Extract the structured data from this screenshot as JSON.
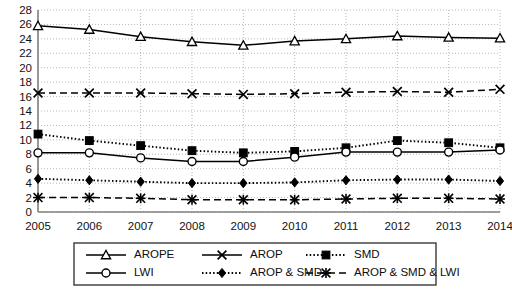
{
  "chart_data": {
    "type": "line",
    "title": "",
    "subtitle": "",
    "xlabel": "",
    "ylabel": "",
    "categories": [
      "2005",
      "2006",
      "2007",
      "2008",
      "2009",
      "2010",
      "2011",
      "2012",
      "2013",
      "2014"
    ],
    "x": [
      2005,
      2006,
      2007,
      2008,
      2009,
      2010,
      2011,
      2012,
      2013,
      2014
    ],
    "ylim": [
      0,
      28
    ],
    "xlim": [
      2005,
      2014
    ],
    "y_ticks": [
      0,
      2,
      4,
      6,
      8,
      10,
      12,
      14,
      16,
      18,
      20,
      22,
      24,
      26,
      28
    ],
    "grid": true,
    "grid_style": "dotted",
    "legend_position": "bottom",
    "series": [
      {
        "name": "AROPE",
        "marker": "triangle",
        "line_style": "solid",
        "values": [
          25.8,
          25.3,
          24.3,
          23.6,
          23.1,
          23.7,
          24.0,
          24.4,
          24.2,
          24.1
        ]
      },
      {
        "name": "AROP",
        "marker": "x",
        "line_style": "dashed",
        "values": [
          16.5,
          16.5,
          16.5,
          16.4,
          16.3,
          16.4,
          16.6,
          16.7,
          16.6,
          17.0
        ]
      },
      {
        "name": "SMD",
        "marker": "square",
        "line_style": "dotted",
        "values": [
          10.8,
          9.9,
          9.2,
          8.5,
          8.2,
          8.4,
          8.9,
          9.9,
          9.6,
          8.9
        ]
      },
      {
        "name": "LWI",
        "marker": "circle",
        "line_style": "solid",
        "values": [
          8.2,
          8.2,
          7.5,
          7.0,
          7.0,
          7.6,
          8.3,
          8.3,
          8.3,
          8.6
        ]
      },
      {
        "name": "AROP & SMD",
        "marker": "diamond",
        "line_style": "dotted",
        "values": [
          4.6,
          4.4,
          4.2,
          4.0,
          4.0,
          4.1,
          4.4,
          4.5,
          4.5,
          4.3
        ]
      },
      {
        "name": "AROP & SMD & LWI",
        "marker": "star",
        "line_style": "dashed",
        "values": [
          2.0,
          2.0,
          1.9,
          1.7,
          1.7,
          1.7,
          1.8,
          1.9,
          1.9,
          1.8
        ]
      }
    ]
  },
  "legend": {
    "entries": [
      {
        "label": "AROPE",
        "marker": "triangle",
        "line_style": "solid"
      },
      {
        "label": "AROP",
        "marker": "x",
        "line_style": "solid"
      },
      {
        "label": "SMD",
        "marker": "square",
        "line_style": "dotted"
      },
      {
        "label": "LWI",
        "marker": "circle",
        "line_style": "solid"
      },
      {
        "label": "AROP & SMD",
        "marker": "diamond",
        "line_style": "dotted"
      },
      {
        "label": "AROP & SMD & LWI",
        "marker": "star",
        "line_style": "dashed"
      }
    ]
  },
  "colors": {
    "line": "#000000",
    "grid": "#b8b8b8",
    "axis": "#808080",
    "text": "#121212",
    "background": "#ffffff"
  }
}
